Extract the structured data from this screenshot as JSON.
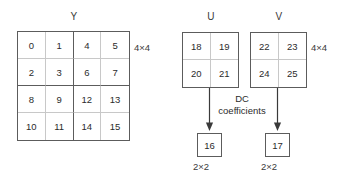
{
  "diagram": {
    "blocks": [
      {
        "id": "y",
        "label": "Y",
        "size_label": "4×4",
        "rows": [
          [
            "0",
            "1",
            "4",
            "5"
          ],
          [
            "2",
            "3",
            "6",
            "7"
          ],
          [
            "8",
            "9",
            "12",
            "13"
          ],
          [
            "10",
            "11",
            "14",
            "15"
          ]
        ]
      },
      {
        "id": "u",
        "label": "U",
        "size_label": "4×4",
        "rows": [
          [
            "18",
            "19"
          ],
          [
            "20",
            "21"
          ]
        ]
      },
      {
        "id": "v",
        "label": "V",
        "size_label": "4×4",
        "rows": [
          [
            "22",
            "23"
          ],
          [
            "24",
            "25"
          ]
        ]
      }
    ],
    "flow": {
      "caption_line1": "DC",
      "caption_line2": "coefficients",
      "arrow_u_name": "down-arrow-icon",
      "arrow_v_name": "down-arrow-icon"
    },
    "dc_results": [
      {
        "id": "dc-u",
        "value": "16",
        "size_label": "2×2"
      },
      {
        "id": "dc-v",
        "value": "17",
        "size_label": "2×2"
      }
    ],
    "colors": {
      "background": "#ffffff",
      "outer_border": "#5c5c5c",
      "inner_grid": "#c8c8c8",
      "text": "#2b2b2b",
      "arrow": "#3a3a3a"
    }
  }
}
